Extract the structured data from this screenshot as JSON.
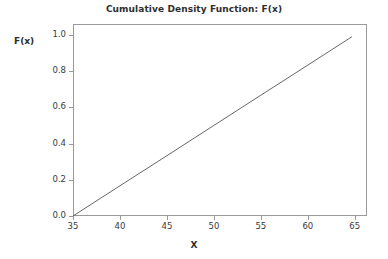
{
  "chart_data": {
    "type": "line",
    "title": "Cumulative Density Function: F(x)",
    "xlabel": "X",
    "ylabel": "F(x)",
    "xlim": [
      35,
      66.3
    ],
    "ylim": [
      0.0,
      1.06
    ],
    "grid": false,
    "legend": null,
    "xticks": [
      35,
      40,
      45,
      50,
      55,
      60,
      65
    ],
    "xtick_labels": [
      "35",
      "40",
      "45",
      "50",
      "55",
      "60",
      "65"
    ],
    "yticks": [
      0.0,
      0.2,
      0.4,
      0.6,
      0.8,
      1.0
    ],
    "ytick_labels": [
      "0.0",
      "0.2",
      "0.4",
      "0.6",
      "0.8",
      "1.0"
    ],
    "series": [
      {
        "name": "F(x)",
        "color": "#555555",
        "x": [
          35,
          40,
          45,
          50,
          55,
          60,
          64.7
        ],
        "values": [
          0.0,
          0.167,
          0.333,
          0.5,
          0.667,
          0.833,
          0.99
        ]
      }
    ],
    "line_color": "#555555",
    "frame_color": "#9a9a9a",
    "background_color": "#ffffff",
    "text_color": "#3a3a3a"
  },
  "axis": {
    "y_label_text": "F(x)",
    "x_label_text": "X"
  }
}
